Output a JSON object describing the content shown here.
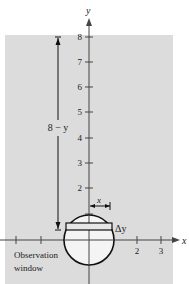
{
  "figure": {
    "colors": {
      "background": "#ffffff",
      "panel": "#dcdcdc",
      "window_fill": "#f4f4f4",
      "ink": "#1a1a1a"
    },
    "axes": {
      "x_label": "x",
      "y_label": "y",
      "y_ticks": [
        "8",
        "7",
        "6",
        "5",
        "4",
        "3",
        "2"
      ],
      "x_ticks": [
        "2",
        "3"
      ]
    },
    "annotations": {
      "depth_label": "8 − y",
      "width_label": "x",
      "strip_label": "Δy",
      "window_label_line1": "Observation",
      "window_label_line2": "window"
    }
  }
}
